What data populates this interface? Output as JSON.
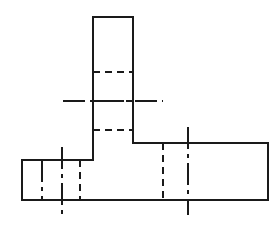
{
  "drawing": {
    "title": "Orthographic view of T-shaped block",
    "type": "engineering-line-drawing",
    "canvas": {
      "width": 278,
      "height": 230,
      "background": "#ffffff"
    },
    "line_styles": {
      "visible_edge": {
        "name": "visible-outline",
        "color": "#1a1a1a",
        "width": 2,
        "dash": "solid"
      },
      "hidden_edge": {
        "name": "hidden-line",
        "color": "#1a1a1a",
        "width": 2,
        "dash": "7,5"
      },
      "center_line": {
        "name": "center-line",
        "color": "#1a1a1a",
        "width": 2,
        "dash": "22,5,4,5"
      }
    },
    "outline": {
      "name": "part-outline",
      "points": "93,17 133,17 133,143 268,143 268,200 22,200 22,160 93,160 93,17"
    },
    "visible_edges": [
      {
        "name": "outline-top-edge",
        "x1": 93,
        "y1": 17,
        "x2": 133,
        "y2": 17
      },
      {
        "name": "outline-column-right-edge",
        "x1": 133,
        "y1": 17,
        "x2": 133,
        "y2": 143
      },
      {
        "name": "outline-right-wing-top-edge",
        "x1": 133,
        "y1": 143,
        "x2": 268,
        "y2": 143
      },
      {
        "name": "outline-far-right-edge",
        "x1": 268,
        "y1": 143,
        "x2": 268,
        "y2": 200
      },
      {
        "name": "outline-bottom-edge",
        "x1": 268,
        "y1": 200,
        "x2": 22,
        "y2": 200
      },
      {
        "name": "outline-far-left-edge",
        "x1": 22,
        "y1": 200,
        "x2": 22,
        "y2": 160
      },
      {
        "name": "outline-left-wing-top-edge",
        "x1": 22,
        "y1": 160,
        "x2": 93,
        "y2": 160
      },
      {
        "name": "outline-column-left-edge",
        "x1": 93,
        "y1": 160,
        "x2": 93,
        "y2": 17
      }
    ],
    "hidden_edges": [
      {
        "name": "hidden-line-column-upper",
        "x1": 93,
        "y1": 72,
        "x2": 133,
        "y2": 72
      },
      {
        "name": "hidden-line-column-middle",
        "x1": 93,
        "y1": 101,
        "x2": 133,
        "y2": 101
      },
      {
        "name": "hidden-line-column-lower",
        "x1": 93,
        "y1": 130,
        "x2": 133,
        "y2": 130
      },
      {
        "name": "hidden-line-left-wing-inner",
        "x1": 80,
        "y1": 160,
        "x2": 80,
        "y2": 200
      },
      {
        "name": "hidden-line-right-wing-inner",
        "x1": 163,
        "y1": 143,
        "x2": 163,
        "y2": 200
      }
    ],
    "center_lines": [
      {
        "name": "center-line-horizontal-column",
        "x1": 63,
        "y1": 101,
        "x2": 163,
        "y2": 101,
        "orientation": "horizontal"
      },
      {
        "name": "center-line-vertical-left-wing",
        "x1": 62,
        "y1": 147,
        "x2": 62,
        "y2": 215,
        "orientation": "vertical"
      },
      {
        "name": "center-line-vertical-right-wing",
        "x1": 188,
        "y1": 127,
        "x2": 188,
        "y2": 215,
        "orientation": "vertical"
      },
      {
        "name": "center-line-left-wing-secondary",
        "x1": 42,
        "y1": 160,
        "x2": 42,
        "y2": 200,
        "orientation": "vertical"
      }
    ]
  }
}
